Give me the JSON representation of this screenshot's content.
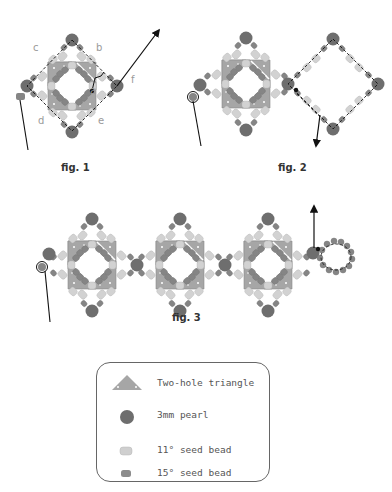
{
  "figures": [
    {
      "id": "fig1",
      "label": "fig. 1",
      "step_labels": [
        "a",
        "b",
        "c",
        "d",
        "e",
        "f"
      ]
    },
    {
      "id": "fig2",
      "label": "fig. 2"
    },
    {
      "id": "fig3",
      "label": "fig. 3"
    }
  ],
  "legend": {
    "items": [
      {
        "icon": "two-hole-triangle-icon",
        "label": "Two-hole triangle"
      },
      {
        "icon": "pearl-icon",
        "label": "3mm pearl"
      },
      {
        "icon": "seed-bead-11-icon",
        "label": "11° seed bead"
      },
      {
        "icon": "seed-bead-15-icon",
        "label": "15° seed bead"
      }
    ]
  },
  "colors": {
    "triangle": "#a6a6a6",
    "pearl": "#6e6e6e",
    "seed_11": "#cfcfcf",
    "seed_15": "#8c8c8c",
    "thread": "#111111"
  }
}
